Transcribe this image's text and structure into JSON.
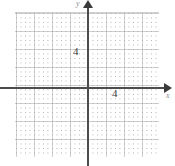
{
  "figure": {
    "kind": "cartesian-coordinate-grid",
    "background_color": "#ffffff",
    "axis_color": "#4c4c4c",
    "major_grid_color": "#c8c8c8",
    "minor_grid_color": "#a5a5a5",
    "label_color": "#3b3b3b",
    "axis_name_color": "#8d8d8d"
  },
  "axes": {
    "x": {
      "name": "x",
      "arrow": "arrow-right",
      "tick_labels": [
        "4"
      ],
      "tick_values": [
        4
      ]
    },
    "y": {
      "name": "y",
      "arrow": "arrow-up",
      "tick_labels": [
        "4"
      ],
      "tick_values": [
        4
      ]
    }
  },
  "chart_data": {
    "type": "scatter",
    "title": "",
    "subtitle": "",
    "xlabel": "x",
    "ylabel": "y",
    "xlim": [
      -10,
      10
    ],
    "ylim": [
      -10,
      10
    ],
    "xticks": [
      4
    ],
    "xticklabels": [
      "4"
    ],
    "yticks": [
      4
    ],
    "yticklabels": [
      "4"
    ],
    "grid": true,
    "grid_major_step": 2,
    "grid_minor_step": 0.5,
    "legend": null,
    "series": [],
    "annotations": []
  }
}
